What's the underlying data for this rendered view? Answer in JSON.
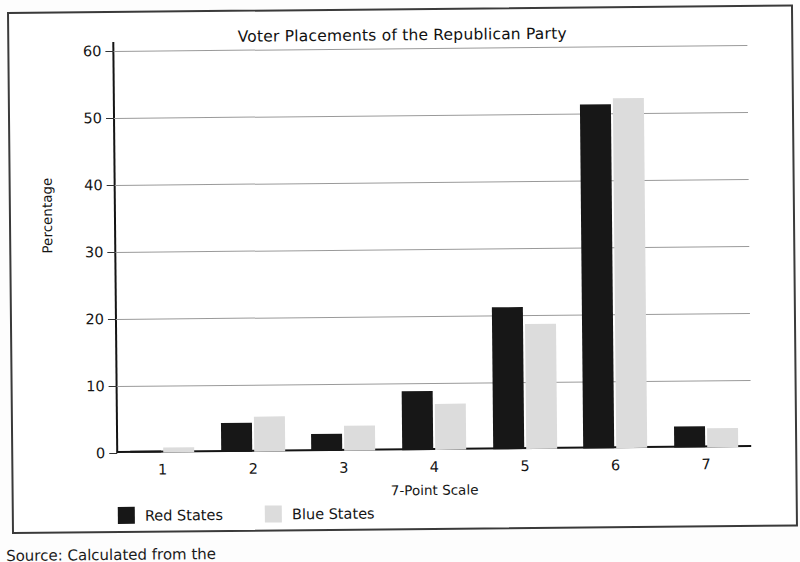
{
  "chart_data": {
    "type": "bar",
    "title": "Voter Placements of the Republican Party",
    "xlabel": "7-Point Scale",
    "ylabel": "Percentage",
    "categories": [
      "1",
      "2",
      "3",
      "4",
      "5",
      "6",
      "7"
    ],
    "series": [
      {
        "name": "Red States",
        "color": "#171717",
        "values": [
          0.3,
          4.3,
          2.5,
          8.8,
          21.2,
          51.3,
          3.1
        ]
      },
      {
        "name": "Blue States",
        "color": "#dcdcdc",
        "values": [
          0.7,
          5.2,
          3.8,
          6.9,
          18.6,
          52.2,
          2.9
        ]
      }
    ],
    "ylim": [
      0,
      60
    ],
    "yticks": [
      0,
      10,
      20,
      30,
      40,
      50,
      60
    ],
    "ytick_labels": [
      "0",
      "10",
      "20",
      "30",
      "40",
      "50",
      "60"
    ],
    "grid": true,
    "legend_position": "bottom-left"
  },
  "caption": {
    "source": "Source: Calculated from the"
  }
}
